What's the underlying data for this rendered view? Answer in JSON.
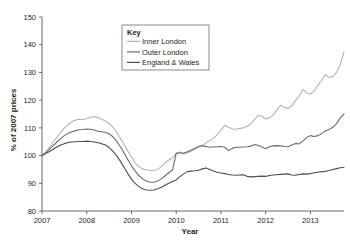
{
  "chart_data": {
    "type": "line",
    "title": "",
    "xlabel": "Year",
    "ylabel": "% of 2007 prices",
    "xlim": [
      2007.0,
      2013.75
    ],
    "ylim": [
      80,
      150
    ],
    "yticks": [
      80,
      90,
      100,
      110,
      120,
      130,
      140,
      150
    ],
    "xticks": [
      2007,
      2008,
      2009,
      2010,
      2011,
      2012,
      2013
    ],
    "ytick_labels": [
      "80",
      "90",
      "100",
      "110",
      "120",
      "130",
      "140",
      "150"
    ],
    "xtick_labels": [
      "2007",
      "2008",
      "2009",
      "2010",
      "2011",
      "2012",
      "2013"
    ],
    "grid": false,
    "legend_position": "top-center",
    "legend_title": "Key",
    "series": [
      {
        "name": "Inner London",
        "color": "#b3b3b3",
        "x": [
          2007.0,
          2007.083,
          2007.167,
          2007.25,
          2007.333,
          2007.417,
          2007.5,
          2007.583,
          2007.667,
          2007.75,
          2007.833,
          2007.917,
          2008.0,
          2008.083,
          2008.167,
          2008.25,
          2008.333,
          2008.417,
          2008.5,
          2008.583,
          2008.667,
          2008.75,
          2008.833,
          2008.917,
          2009.0,
          2009.083,
          2009.167,
          2009.25,
          2009.333,
          2009.417,
          2009.5,
          2009.583,
          2009.667,
          2009.75,
          2009.833,
          2009.917,
          2010.0,
          2010.083,
          2010.167,
          2010.25,
          2010.333,
          2010.417,
          2010.5,
          2010.583,
          2010.667,
          2010.75,
          2010.833,
          2010.917,
          2011.0,
          2011.083,
          2011.167,
          2011.25,
          2011.333,
          2011.417,
          2011.5,
          2011.583,
          2011.667,
          2011.75,
          2011.833,
          2011.917,
          2012.0,
          2012.083,
          2012.167,
          2012.25,
          2012.333,
          2012.417,
          2012.5,
          2012.583,
          2012.667,
          2012.75,
          2012.833,
          2012.917,
          2013.0,
          2013.083,
          2013.167,
          2013.25,
          2013.333,
          2013.417,
          2013.5,
          2013.583,
          2013.667,
          2013.75
        ],
        "values": [
          100.0,
          101.2,
          103.0,
          104.8,
          106.6,
          108.3,
          109.9,
          111.2,
          112.2,
          112.8,
          113.1,
          113.0,
          113.3,
          113.8,
          114.0,
          113.7,
          113.1,
          112.5,
          111.6,
          110.3,
          108.5,
          106.3,
          104.0,
          101.7,
          99.4,
          97.4,
          96.0,
          95.2,
          94.8,
          94.6,
          94.6,
          95.0,
          96.0,
          97.3,
          98.4,
          99.2,
          100.8,
          101.3,
          100.6,
          101.0,
          101.6,
          102.3,
          103.0,
          103.6,
          104.6,
          105.4,
          106.2,
          107.6,
          109.2,
          110.9,
          110.2,
          109.6,
          109.5,
          109.8,
          110.0,
          110.6,
          111.5,
          113.0,
          114.5,
          114.2,
          113.2,
          113.6,
          114.7,
          116.4,
          118.2,
          117.3,
          117.0,
          118.0,
          119.9,
          121.5,
          123.9,
          122.6,
          122.2,
          123.3,
          125.4,
          127.1,
          129.2,
          128.2,
          128.5,
          130.0,
          132.8,
          137.4
        ]
      },
      {
        "name": "Outer London",
        "color": "#6b6b6b",
        "x": [
          2007.0,
          2007.083,
          2007.167,
          2007.25,
          2007.333,
          2007.417,
          2007.5,
          2007.583,
          2007.667,
          2007.75,
          2007.833,
          2007.917,
          2008.0,
          2008.083,
          2008.167,
          2008.25,
          2008.333,
          2008.417,
          2008.5,
          2008.583,
          2008.667,
          2008.75,
          2008.833,
          2008.917,
          2009.0,
          2009.083,
          2009.167,
          2009.25,
          2009.333,
          2009.417,
          2009.5,
          2009.583,
          2009.667,
          2009.75,
          2009.833,
          2009.917,
          2010.0,
          2010.083,
          2010.167,
          2010.25,
          2010.333,
          2010.417,
          2010.5,
          2010.583,
          2010.667,
          2010.75,
          2010.833,
          2010.917,
          2011.0,
          2011.083,
          2011.167,
          2011.25,
          2011.333,
          2011.417,
          2011.5,
          2011.583,
          2011.667,
          2011.75,
          2011.833,
          2011.917,
          2012.0,
          2012.083,
          2012.167,
          2012.25,
          2012.333,
          2012.417,
          2012.5,
          2012.583,
          2012.667,
          2012.75,
          2012.833,
          2012.917,
          2013.0,
          2013.083,
          2013.167,
          2013.25,
          2013.333,
          2013.417,
          2013.5,
          2013.583,
          2013.667,
          2013.75
        ],
        "values": [
          100.0,
          101.0,
          102.3,
          103.6,
          104.9,
          106.1,
          107.2,
          108.0,
          108.6,
          109.0,
          109.3,
          109.4,
          109.6,
          109.5,
          109.2,
          108.8,
          108.6,
          108.4,
          107.9,
          106.8,
          105.2,
          103.2,
          101.0,
          98.6,
          96.3,
          94.4,
          92.8,
          91.6,
          90.8,
          90.4,
          90.4,
          90.8,
          91.6,
          92.7,
          93.8,
          94.8,
          100.8,
          101.0,
          100.8,
          101.4,
          102.0,
          102.6,
          103.3,
          103.6,
          103.3,
          103.0,
          103.1,
          103.2,
          103.3,
          103.0,
          101.8,
          102.6,
          103.0,
          103.0,
          103.1,
          103.2,
          103.4,
          104.0,
          103.6,
          103.1,
          102.5,
          103.2,
          103.5,
          103.6,
          103.5,
          103.3,
          103.2,
          103.8,
          104.4,
          104.2,
          105.3,
          106.5,
          107.2,
          106.9,
          107.2,
          107.9,
          108.9,
          109.4,
          110.2,
          111.5,
          113.6,
          115.0
        ]
      },
      {
        "name": "England & Wales",
        "color": "#4d4d4d",
        "x": [
          2007.0,
          2007.083,
          2007.167,
          2007.25,
          2007.333,
          2007.417,
          2007.5,
          2007.583,
          2007.667,
          2007.75,
          2007.833,
          2007.917,
          2008.0,
          2008.083,
          2008.167,
          2008.25,
          2008.333,
          2008.417,
          2008.5,
          2008.583,
          2008.667,
          2008.75,
          2008.833,
          2008.917,
          2009.0,
          2009.083,
          2009.167,
          2009.25,
          2009.333,
          2009.417,
          2009.5,
          2009.583,
          2009.667,
          2009.75,
          2009.833,
          2009.917,
          2010.0,
          2010.083,
          2010.167,
          2010.25,
          2010.333,
          2010.417,
          2010.5,
          2010.583,
          2010.667,
          2010.75,
          2010.833,
          2010.917,
          2011.0,
          2011.083,
          2011.167,
          2011.25,
          2011.333,
          2011.417,
          2011.5,
          2011.583,
          2011.667,
          2011.75,
          2011.833,
          2011.917,
          2012.0,
          2012.083,
          2012.167,
          2012.25,
          2012.333,
          2012.417,
          2012.5,
          2012.583,
          2012.667,
          2012.75,
          2012.833,
          2012.917,
          2013.0,
          2013.083,
          2013.167,
          2013.25,
          2013.333,
          2013.417,
          2013.5,
          2013.583,
          2013.667,
          2013.75
        ],
        "values": [
          100.0,
          100.7,
          101.5,
          102.3,
          103.1,
          103.8,
          104.3,
          104.7,
          104.9,
          105.0,
          105.1,
          105.1,
          105.2,
          105.1,
          104.9,
          104.6,
          104.3,
          103.8,
          102.9,
          101.6,
          100.0,
          98.0,
          95.8,
          93.5,
          91.5,
          90.0,
          88.8,
          88.0,
          87.6,
          87.5,
          87.6,
          88.0,
          88.6,
          89.3,
          90.0,
          90.6,
          91.2,
          92.4,
          93.4,
          94.2,
          94.4,
          94.5,
          94.7,
          95.2,
          95.5,
          95.0,
          94.4,
          94.0,
          93.7,
          93.5,
          93.2,
          93.0,
          92.9,
          93.0,
          93.1,
          92.5,
          92.3,
          92.4,
          92.5,
          92.6,
          92.5,
          92.8,
          93.0,
          93.1,
          93.2,
          93.3,
          93.4,
          93.0,
          92.9,
          93.2,
          93.4,
          93.3,
          93.5,
          93.8,
          94.0,
          94.2,
          94.3,
          94.6,
          95.0,
          95.3,
          95.6,
          95.8
        ]
      }
    ]
  },
  "legend": {
    "title": "Key",
    "entries": [
      {
        "label": "Inner London",
        "color": "#b3b3b3"
      },
      {
        "label": "Outer London",
        "color": "#6b6b6b"
      },
      {
        "label": "England & Wales",
        "color": "#4d4d4d"
      }
    ]
  },
  "axes": {
    "x_title": "Year",
    "y_title": "% of 2007 prices"
  }
}
